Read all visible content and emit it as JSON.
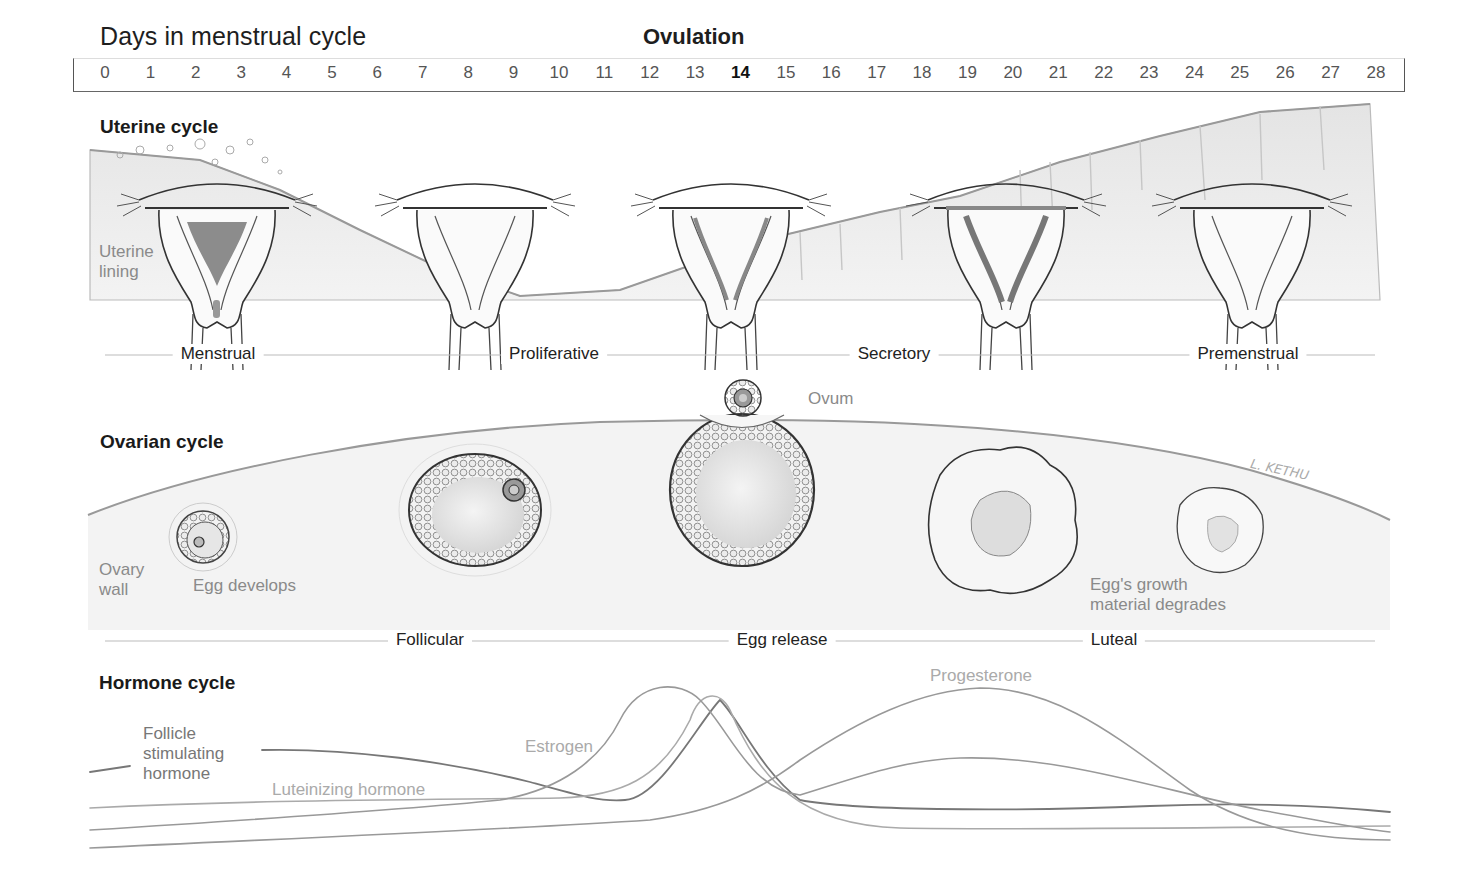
{
  "header": {
    "title": "Days in menstrual cycle",
    "ovulation_label": "Ovulation"
  },
  "day_axis": {
    "days": [
      "0",
      "1",
      "2",
      "3",
      "4",
      "5",
      "6",
      "7",
      "8",
      "9",
      "10",
      "11",
      "12",
      "13",
      "14",
      "15",
      "16",
      "17",
      "18",
      "19",
      "20",
      "21",
      "22",
      "23",
      "24",
      "25",
      "26",
      "27",
      "28"
    ],
    "highlighted_day": "14"
  },
  "uterine_cycle": {
    "title": "Uterine cycle",
    "lining_label": "Uterine\nlining",
    "phases": [
      "Menstrual",
      "Proliferative",
      "Secretory",
      "Premenstrual"
    ]
  },
  "ovarian_cycle": {
    "title": "Ovarian cycle",
    "ovum_label": "Ovum",
    "ovary_wall_label": "Ovary\nwall",
    "egg_develops_label": "Egg develops",
    "degrades_label": "Egg's growth\nmaterial degrades",
    "signature": "L. KETHU",
    "phases": [
      "Follicular",
      "Egg release",
      "Luteal"
    ]
  },
  "hormone_cycle": {
    "title": "Hormone cycle",
    "labels": {
      "fsh": "Follicle\nstimulating\nhormone",
      "lh": "Luteinizing hormone",
      "estrogen": "Estrogen",
      "progesterone": "Progesterone"
    }
  },
  "colors": {
    "ink": "#222222",
    "soft_text": "#8a8a8a",
    "lining": "#d9d9d9",
    "blood": "#8c8c8c",
    "curve_dark": "#777777",
    "curve_light": "#aaaaaa"
  }
}
